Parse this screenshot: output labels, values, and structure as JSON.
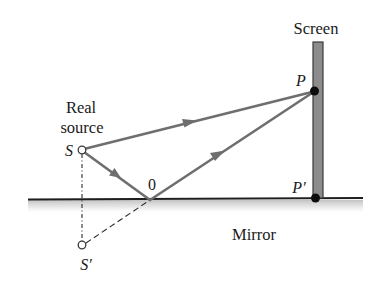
{
  "diagram": {
    "type": "optics-lloyds-mirror",
    "labels": {
      "screen": "Screen",
      "real": "Real",
      "source": "source",
      "source_point": "S",
      "image_source": "S′",
      "reflection_point": "0",
      "point_p": "P",
      "point_p_prime": "P′",
      "mirror": "Mirror"
    },
    "colors": {
      "ray": "#6e6e6e",
      "screen_fill": "#8c8c8c",
      "screen_edge": "#3a3a3a",
      "mirror_line": "#1e1e1e",
      "dot": "#0d0d0d",
      "text": "#1a1a1a"
    },
    "points": {
      "S": [
        82,
        150
      ],
      "S_prime": [
        82,
        245
      ],
      "O": [
        150,
        200
      ],
      "P": [
        314,
        91
      ],
      "P_prime": [
        315,
        198
      ]
    },
    "rays": [
      {
        "from": "S",
        "to": "P",
        "kind": "direct"
      },
      {
        "from": "S",
        "to": "O",
        "kind": "incident"
      },
      {
        "from": "O",
        "to": "P",
        "kind": "reflected"
      },
      {
        "from": "S_prime",
        "to": "O",
        "kind": "virtual-dashed"
      },
      {
        "from": "S",
        "to": "S_prime",
        "kind": "construction-dashed"
      }
    ]
  }
}
